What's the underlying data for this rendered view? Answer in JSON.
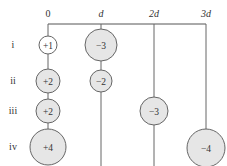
{
  "columns": [
    {
      "label": "0",
      "x": 48
    },
    {
      "label": "d",
      "x": 101,
      "italic": true
    },
    {
      "label": "2d",
      "x": 154,
      "italic": true
    },
    {
      "label": "3d",
      "x": 206,
      "italic": true
    }
  ],
  "rows": [
    {
      "label": "i",
      "y": 45
    },
    {
      "label": "ii",
      "y": 81
    },
    {
      "label": "iii",
      "y": 111
    },
    {
      "label": "iv",
      "y": 147
    }
  ],
  "charges": [
    {
      "row": "i",
      "col": "0",
      "label": "+1",
      "x": 48,
      "y": 45,
      "r": 9,
      "fill": "#ffffff"
    },
    {
      "row": "i",
      "col": "d",
      "label": "−3",
      "x": 101,
      "y": 45,
      "r": 16,
      "fill": "#e6e6e6"
    },
    {
      "row": "ii",
      "col": "0",
      "label": "+2",
      "x": 48,
      "y": 81,
      "r": 12,
      "fill": "#e6e6e6"
    },
    {
      "row": "ii",
      "col": "d",
      "label": "−2",
      "x": 101,
      "y": 81,
      "r": 11,
      "fill": "#e6e6e6"
    },
    {
      "row": "iii",
      "col": "0",
      "label": "+2",
      "x": 48,
      "y": 111,
      "r": 12,
      "fill": "#e6e6e6"
    },
    {
      "row": "iii",
      "col": "2d",
      "label": "−3",
      "x": 154,
      "y": 111,
      "r": 14,
      "fill": "#e6e6e6"
    },
    {
      "row": "iv",
      "col": "0",
      "label": "+4",
      "x": 48,
      "y": 147,
      "r": 18,
      "fill": "#e6e6e6"
    },
    {
      "row": "iv",
      "col": "3d",
      "label": "−4",
      "x": 206,
      "y": 148,
      "r": 19,
      "fill": "#e6e6e6"
    }
  ],
  "colors": {
    "line": "#555555",
    "circle_stroke": "#666666",
    "circle_fill": "#e6e6e6"
  }
}
